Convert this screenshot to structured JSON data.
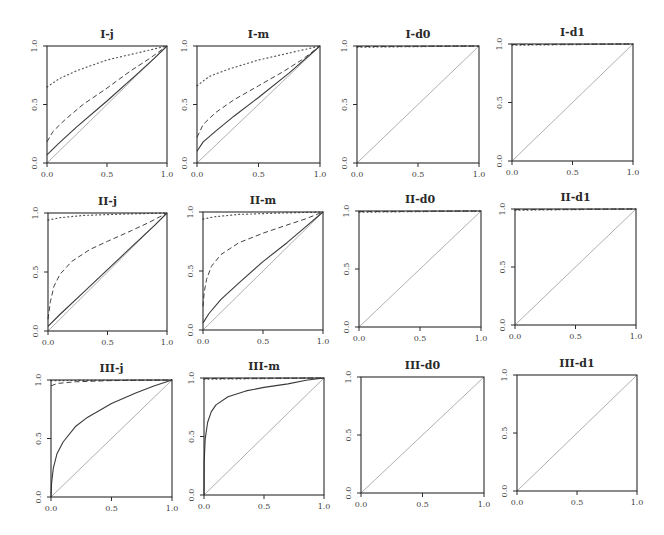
{
  "chart_data": {
    "type": "line",
    "layout": {
      "rows": 3,
      "cols": 4,
      "grid": false,
      "legend": "none"
    },
    "xlim": [
      0,
      1
    ],
    "ylim": [
      0,
      1
    ],
    "xticks": [
      "0.0",
      "0.5",
      "1.0"
    ],
    "yticks": [
      "0.0",
      "0.5",
      "1.0"
    ],
    "panels": [
      {
        "title": "I-j",
        "box": [
          47,
          46,
          167,
          163
        ],
        "series": [
          {
            "name": "diagonal",
            "style": "thin",
            "x": [
              0,
              1
            ],
            "y": [
              0,
              1
            ]
          },
          {
            "name": "solid",
            "style": "solid",
            "x": [
              0,
              0.1,
              0.25,
              0.5,
              0.75,
              0.9,
              1
            ],
            "y": [
              0.07,
              0.17,
              0.31,
              0.53,
              0.76,
              0.9,
              1
            ]
          },
          {
            "name": "dashed",
            "style": "dashed",
            "x": [
              0,
              0.05,
              0.15,
              0.3,
              0.5,
              0.7,
              0.85,
              1
            ],
            "y": [
              0.18,
              0.27,
              0.37,
              0.5,
              0.64,
              0.79,
              0.89,
              1
            ]
          },
          {
            "name": "dotted",
            "style": "dotted",
            "x": [
              0,
              0.1,
              0.25,
              0.5,
              0.75,
              1
            ],
            "y": [
              0.65,
              0.72,
              0.79,
              0.88,
              0.94,
              1
            ]
          }
        ]
      },
      {
        "title": "I-m",
        "box": [
          197,
          46,
          320,
          163
        ],
        "series": [
          {
            "name": "diagonal",
            "style": "thin",
            "x": [
              0,
              1
            ],
            "y": [
              0,
              1
            ]
          },
          {
            "name": "solid",
            "style": "solid",
            "x": [
              0,
              0.05,
              0.15,
              0.3,
              0.5,
              0.75,
              1
            ],
            "y": [
              0.1,
              0.18,
              0.27,
              0.4,
              0.56,
              0.77,
              1
            ]
          },
          {
            "name": "dashed",
            "style": "dashed",
            "x": [
              0,
              0.05,
              0.15,
              0.3,
              0.5,
              0.7,
              0.85,
              1
            ],
            "y": [
              0.22,
              0.33,
              0.43,
              0.54,
              0.66,
              0.78,
              0.88,
              1
            ]
          },
          {
            "name": "dotted",
            "style": "dotted",
            "x": [
              0,
              0.1,
              0.25,
              0.5,
              0.75,
              1
            ],
            "y": [
              0.66,
              0.74,
              0.8,
              0.88,
              0.94,
              1
            ]
          }
        ]
      },
      {
        "title": "I-d0",
        "box": [
          357,
          46,
          479,
          163
        ],
        "series": [
          {
            "name": "diagonal",
            "style": "thin",
            "x": [
              0,
              1
            ],
            "y": [
              0,
              1
            ]
          },
          {
            "name": "dashed",
            "style": "dashed",
            "x": [
              0,
              1
            ],
            "y": [
              0.995,
              1
            ]
          },
          {
            "name": "dotted",
            "style": "dotted",
            "x": [
              0,
              1
            ],
            "y": [
              0.99,
              1
            ]
          }
        ]
      },
      {
        "title": "I-d1",
        "box": [
          512,
          44,
          633,
          161
        ],
        "series": [
          {
            "name": "diagonal",
            "style": "thin",
            "x": [
              0,
              1
            ],
            "y": [
              0,
              1
            ]
          },
          {
            "name": "dashed",
            "style": "dashed",
            "x": [
              0,
              1
            ],
            "y": [
              0.995,
              1
            ]
          },
          {
            "name": "dotted",
            "style": "dotted",
            "x": [
              0,
              1
            ],
            "y": [
              0.99,
              1
            ]
          }
        ]
      },
      {
        "title": "II-j",
        "box": [
          48,
          213,
          167,
          331
        ],
        "series": [
          {
            "name": "diagonal",
            "style": "thin",
            "x": [
              0,
              1
            ],
            "y": [
              0,
              1
            ]
          },
          {
            "name": "solid",
            "style": "solid",
            "x": [
              0,
              0.1,
              0.3,
              0.5,
              0.7,
              0.9,
              1
            ],
            "y": [
              0.04,
              0.14,
              0.33,
              0.52,
              0.71,
              0.9,
              1
            ]
          },
          {
            "name": "dashed",
            "style": "dashed",
            "x": [
              0,
              0.02,
              0.05,
              0.1,
              0.2,
              0.35,
              0.5,
              0.7,
              0.85,
              1
            ],
            "y": [
              0.1,
              0.25,
              0.38,
              0.48,
              0.59,
              0.69,
              0.76,
              0.85,
              0.92,
              1
            ]
          },
          {
            "name": "dotted",
            "style": "dotted",
            "x": [
              0,
              0.1,
              0.3,
              0.6,
              1
            ],
            "y": [
              0.94,
              0.96,
              0.98,
              0.99,
              1
            ]
          }
        ]
      },
      {
        "title": "II-m",
        "box": [
          203,
          212,
          323,
          330
        ],
        "series": [
          {
            "name": "diagonal",
            "style": "thin",
            "x": [
              0,
              1
            ],
            "y": [
              0,
              1
            ]
          },
          {
            "name": "solid",
            "style": "solid",
            "x": [
              0,
              0.05,
              0.15,
              0.3,
              0.5,
              0.7,
              0.85,
              1
            ],
            "y": [
              0.06,
              0.14,
              0.26,
              0.4,
              0.58,
              0.74,
              0.87,
              1
            ]
          },
          {
            "name": "dashed",
            "style": "dashed",
            "x": [
              0,
              0.01,
              0.03,
              0.07,
              0.15,
              0.3,
              0.5,
              0.7,
              0.85,
              1
            ],
            "y": [
              0.2,
              0.32,
              0.43,
              0.54,
              0.64,
              0.74,
              0.82,
              0.89,
              0.94,
              1
            ]
          },
          {
            "name": "dotted",
            "style": "dotted",
            "x": [
              0,
              0.1,
              0.3,
              0.6,
              1
            ],
            "y": [
              0.94,
              0.96,
              0.98,
              0.99,
              1
            ]
          }
        ]
      },
      {
        "title": "II-d0",
        "box": [
          359,
          211,
          481,
          327
        ],
        "series": [
          {
            "name": "diagonal",
            "style": "thin",
            "x": [
              0,
              1
            ],
            "y": [
              0,
              1
            ]
          },
          {
            "name": "dashed",
            "style": "dashed",
            "x": [
              0,
              1
            ],
            "y": [
              0.995,
              1
            ]
          },
          {
            "name": "dotted",
            "style": "dotted",
            "x": [
              0,
              1
            ],
            "y": [
              0.99,
              1
            ]
          }
        ]
      },
      {
        "title": "II-d1",
        "box": [
          515,
          209,
          636,
          325
        ],
        "series": [
          {
            "name": "diagonal",
            "style": "thin",
            "x": [
              0,
              1
            ],
            "y": [
              0,
              1
            ]
          },
          {
            "name": "dashed",
            "style": "dashed",
            "x": [
              0,
              1
            ],
            "y": [
              0.995,
              1
            ]
          },
          {
            "name": "dotted",
            "style": "dotted",
            "x": [
              0,
              1
            ],
            "y": [
              0.99,
              1
            ]
          }
        ]
      },
      {
        "title": "III-j",
        "box": [
          51,
          380,
          172,
          497
        ],
        "series": [
          {
            "name": "diagonal",
            "style": "thin",
            "x": [
              0,
              1
            ],
            "y": [
              0,
              1
            ]
          },
          {
            "name": "solid",
            "style": "solid",
            "x": [
              0,
              0.005,
              0.02,
              0.05,
              0.1,
              0.2,
              0.3,
              0.5,
              0.7,
              0.85,
              1
            ],
            "y": [
              0,
              0.12,
              0.25,
              0.37,
              0.47,
              0.6,
              0.68,
              0.8,
              0.89,
              0.95,
              1
            ]
          },
          {
            "name": "dashed",
            "style": "dashed",
            "x": [
              0,
              0.05,
              0.2,
              0.5,
              1
            ],
            "y": [
              0.95,
              0.97,
              0.985,
              0.995,
              1
            ]
          },
          {
            "name": "dotted",
            "style": "dotted",
            "x": [
              0,
              1
            ],
            "y": [
              0.995,
              1
            ]
          }
        ]
      },
      {
        "title": "III-m",
        "box": [
          204,
          378,
          324,
          495
        ],
        "series": [
          {
            "name": "diagonal",
            "style": "thin",
            "x": [
              0,
              1
            ],
            "y": [
              0,
              1
            ]
          },
          {
            "name": "solid",
            "style": "solid",
            "x": [
              0,
              0.002,
              0.01,
              0.03,
              0.06,
              0.1,
              0.2,
              0.35,
              0.5,
              0.7,
              0.85,
              1
            ],
            "y": [
              0,
              0.28,
              0.48,
              0.62,
              0.71,
              0.77,
              0.84,
              0.89,
              0.92,
              0.95,
              0.98,
              1
            ]
          },
          {
            "name": "dashed",
            "style": "dashed",
            "x": [
              0,
              1
            ],
            "y": [
              0.995,
              1
            ]
          },
          {
            "name": "dotted",
            "style": "dotted",
            "x": [
              0,
              1
            ],
            "y": [
              0.99,
              1
            ]
          }
        ]
      },
      {
        "title": "III-d0",
        "box": [
          361,
          377,
          484,
          493
        ],
        "series": [
          {
            "name": "diagonal",
            "style": "thin",
            "x": [
              0,
              1
            ],
            "y": [
              0,
              1
            ]
          }
        ]
      },
      {
        "title": "III-d1",
        "box": [
          517,
          375,
          637,
          491
        ],
        "series": [
          {
            "name": "diagonal",
            "style": "thin",
            "x": [
              0,
              1
            ],
            "y": [
              0,
              1
            ]
          }
        ]
      }
    ]
  },
  "colors": {
    "axis": "#2b2b2b",
    "solid": "#3a3a3a",
    "dashed": "#444444",
    "dotted": "#555555",
    "diagonal": "#9a9a9a"
  }
}
